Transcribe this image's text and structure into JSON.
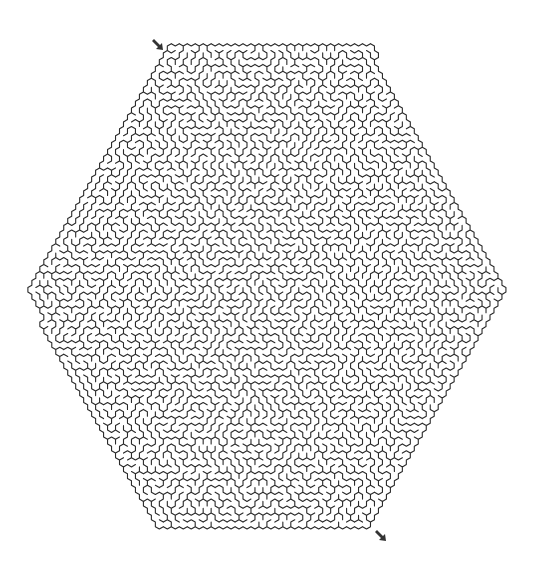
{
  "puzzle": {
    "type": "hexagonal-maze",
    "shape": "hexagon",
    "wall_color": "#2a2a2a",
    "background": "#ffffff",
    "wall_width": 1.1,
    "hexagon": {
      "top_left": [
        165,
        47
      ],
      "top_right": [
        370,
        47
      ],
      "right": [
        505,
        290
      ],
      "bottom_right": [
        370,
        530
      ],
      "bottom_left": [
        155,
        530
      ],
      "left": [
        25,
        290
      ]
    },
    "cell_size": 4.6,
    "seed": 1337
  },
  "start": {
    "label": "Start",
    "icon": "arrow-down-right-icon",
    "x": 151,
    "y": 38
  },
  "finish": {
    "label": "Finish",
    "icon": "arrow-down-right-icon",
    "x": 374,
    "y": 529
  }
}
